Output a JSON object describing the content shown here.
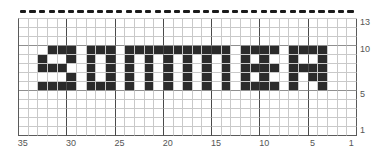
{
  "chart_data": {
    "type": "heatmap",
    "title": "",
    "subtitle": "",
    "xlabel": "",
    "ylabel": "",
    "word": "SUMMER",
    "grid": {
      "columns": 35,
      "rows": 13
    },
    "x_direction": "right-to-left",
    "y_direction": "bottom-to-top",
    "xlim": [
      1,
      35
    ],
    "ylim": [
      1,
      13
    ],
    "x_ticks": [
      35,
      30,
      25,
      20,
      15,
      10,
      5,
      1
    ],
    "x_tick_labels": [
      "35",
      "30",
      "25",
      "20",
      "15",
      "10",
      "5",
      "1"
    ],
    "y_ticks": [
      13,
      10,
      5,
      1
    ],
    "y_tick_labels": [
      "13",
      "10",
      "5",
      "1"
    ],
    "grid_on": true,
    "legend_position": "none",
    "major_gridline_every": 5,
    "colors": {
      "filled": "#2b2b2b",
      "empty": "#ffffff",
      "minor_gridline": "#c9c9c9",
      "major_gridline": "#4a4a4a",
      "axis_text": "#555555",
      "dash_marker": "#1a1a1a"
    },
    "top_marker": {
      "style": "dashed",
      "count": 35,
      "present": true
    },
    "filled_rows_bottom_to_top": [
      6,
      7,
      8,
      9,
      10
    ],
    "rows": [
      {
        "y": 13,
        "filled_x": []
      },
      {
        "y": 12,
        "filled_x": []
      },
      {
        "y": 11,
        "filled_x": []
      },
      {
        "y": 10,
        "filled_x": [
          32,
          31,
          30,
          28,
          27,
          26,
          24,
          23,
          22,
          21,
          20,
          19,
          18,
          17,
          16,
          15,
          14,
          12,
          11,
          10,
          9,
          7,
          6,
          5,
          4
        ]
      },
      {
        "y": 9,
        "filled_x": [
          33,
          30,
          28,
          26,
          24,
          22,
          20,
          18,
          16,
          14,
          12,
          10,
          7,
          4
        ]
      },
      {
        "y": 8,
        "filled_x": [
          33,
          32,
          31,
          28,
          26,
          24,
          22,
          20,
          18,
          16,
          14,
          12,
          11,
          10,
          9,
          7,
          6,
          5,
          4
        ]
      },
      {
        "y": 7,
        "filled_x": [
          30,
          28,
          26,
          24,
          22,
          20,
          18,
          16,
          14,
          12,
          10,
          7,
          5,
          4
        ]
      },
      {
        "y": 6,
        "filled_x": [
          33,
          32,
          31,
          30,
          28,
          27,
          26,
          24,
          22,
          20,
          18,
          16,
          14,
          12,
          11,
          10,
          9,
          7,
          4
        ]
      },
      {
        "y": 5,
        "filled_x": []
      },
      {
        "y": 4,
        "filled_x": []
      },
      {
        "y": 3,
        "filled_x": []
      },
      {
        "y": 2,
        "filled_x": []
      },
      {
        "y": 1,
        "filled_x": []
      }
    ]
  }
}
